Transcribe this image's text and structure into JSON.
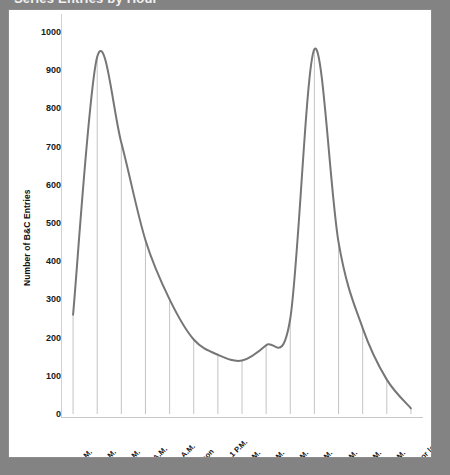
{
  "title": {
    "text": "Series Entries by Hour",
    "visible_fragment": "clipped at top edge"
  },
  "frame": {
    "background": "#ffffff",
    "page_background": "#838383",
    "border_color": "#8c8c8c"
  },
  "chart_data": {
    "type": "line",
    "title": "Series Entries by Hour",
    "xlabel": "",
    "ylabel": "Number of B&C Entries",
    "ylim": [
      0,
      1000
    ],
    "yticks": [
      0,
      100,
      200,
      300,
      400,
      500,
      600,
      700,
      800,
      900,
      1000
    ],
    "grid": false,
    "legend": "none",
    "line_color": "#767676",
    "line_width": 2,
    "smoothing": "spline",
    "drop_lines": true,
    "drop_line_color": "#bdbdbd",
    "categories": [
      "6 - 7 A.M.",
      "7 - 8 A.M.",
      "8 - 9 A.M.",
      "9 - 10 A.M.",
      "10 - 11 A.M.",
      "11 - Noon",
      "Noon - 1 P.M.",
      "1 - 2 P.M.",
      "2 - 3 P.M.",
      "3 - 4 P.M.",
      "4 - 5 P.M.",
      "5 - 6 P.M.",
      "6 - 7 P.M.",
      "7 - 8 P.M.",
      "8 P.M. or later"
    ],
    "values": [
      260,
      935,
      710,
      455,
      300,
      195,
      155,
      140,
      180,
      250,
      955,
      450,
      225,
      90,
      15
    ]
  }
}
